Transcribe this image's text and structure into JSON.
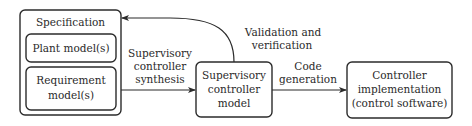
{
  "diagram": {
    "type": "flowchart",
    "nodes": {
      "specification": {
        "label": "Specification"
      },
      "plant_models": {
        "label": "Plant model(s)"
      },
      "requirement_models": {
        "line1": "Requirement",
        "line2": "model(s)"
      },
      "supervisory_model": {
        "line1": "Supervisory",
        "line2": "controller",
        "line3": "model"
      },
      "controller_impl": {
        "line1": "Controller",
        "line2": "implementation",
        "line3": "(control software)"
      }
    },
    "edges": {
      "synthesis": {
        "line1": "Supervisory",
        "line2": "controller",
        "line3": "synthesis",
        "from": "specification",
        "to": "supervisory_model"
      },
      "validation": {
        "line1": "Validation and",
        "line2": "verification",
        "from": "supervisory_model",
        "to": "specification"
      },
      "codegen": {
        "line1": "Code",
        "line2": "generation",
        "from": "supervisory_model",
        "to": "controller_impl"
      }
    },
    "colors": {
      "stroke": "#2b2b2b",
      "text": "#2a2a2a",
      "background": "#ffffff"
    }
  }
}
